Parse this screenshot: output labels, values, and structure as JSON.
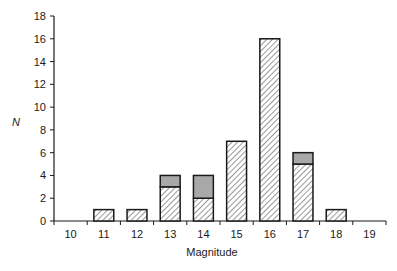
{
  "chart_data": {
    "type": "bar",
    "stacked": true,
    "title": "",
    "xlabel": "Magnitude",
    "ylabel": "N",
    "categories": [
      "10",
      "11",
      "12",
      "13",
      "14",
      "15",
      "16",
      "17",
      "18",
      "19"
    ],
    "series": [
      {
        "name": "hatched",
        "pattern": "diagonal-hatch",
        "values": [
          0,
          1,
          1,
          3,
          2,
          7,
          16,
          5,
          1,
          0
        ]
      },
      {
        "name": "stippled",
        "pattern": "grey-stipple",
        "values": [
          0,
          0,
          0,
          1,
          2,
          0,
          0,
          1,
          0,
          0
        ]
      }
    ],
    "totals": [
      0,
      1,
      1,
      4,
      4,
      7,
      16,
      6,
      1,
      0
    ],
    "ylim": [
      0,
      18
    ],
    "yticks": [
      0,
      2,
      4,
      6,
      8,
      10,
      12,
      14,
      16,
      18
    ],
    "grid": false,
    "legend": null
  },
  "colors": {
    "stroke": "#1a1a1a",
    "hatch": "#333333",
    "stipple": "#a8a8a8",
    "background": "#ffffff"
  }
}
